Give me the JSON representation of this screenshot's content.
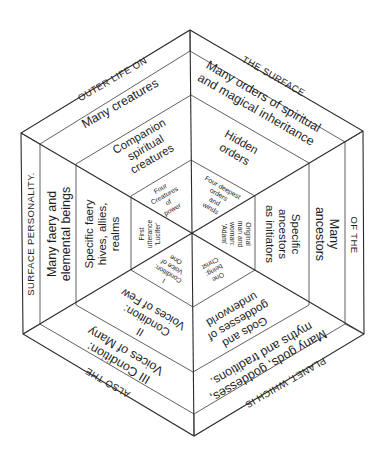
{
  "diagram": {
    "type": "concentric-hexagon",
    "outer_band": {
      "top_left": "OUTER LIFE ON",
      "top_right": "THE SURFACE",
      "right": "OF THE",
      "bottom_right": "PLANET, WHICH IS",
      "bottom_left": "ALSO THE",
      "left": "SURFACE PERSONALITY."
    },
    "ring2": {
      "top_left": "Many creatures",
      "top_right_line1": "Many orders of spiritual",
      "top_right_line2": "and magical inheritance",
      "right_line1": "Many",
      "right_line2": "ancestors",
      "bottom_right_line1": "Many gods, goddesses,",
      "bottom_right_line2": "myths and traditions.",
      "bottom_left_line1": "III Condition:",
      "bottom_left_line2": "Voices of Many",
      "left_line1": "Many faery and",
      "left_line2": "elemental beings"
    },
    "ring3": {
      "top_left_line1": "Companion",
      "top_left_line2": "spiritual",
      "top_left_line3": "creatures",
      "top_right_line1": "Hidden",
      "top_right_line2": "orders",
      "right_line1": "Specific",
      "right_line2": "ancestors",
      "right_line3": "as initiators",
      "bottom_right_line1": "Gods and",
      "bottom_right_line2": "goddesses of",
      "bottom_right_line3": "underworld",
      "bottom_left_line1": "II",
      "bottom_left_line2": "Condition:",
      "bottom_left_line3": "Voices of Few",
      "left_line1": "Specific faery",
      "left_line2": "hives, allies,",
      "left_line3": "realms"
    },
    "core": {
      "top_left_line1": "Four",
      "top_left_line2": "Creatures",
      "top_left_line3": "of",
      "top_left_line4": "power",
      "top_right_line1": "Four deepest",
      "top_right_line2": "orders",
      "top_right_line3": "and",
      "top_right_line4": "winds",
      "right_line1": "Original",
      "right_line2": "man and",
      "right_line3": "woman:",
      "right_line4": "'Adam'",
      "bottom_right_line1": "One",
      "bottom_right_line2": "being:",
      "bottom_right_line3": "Christ",
      "bottom_left_line1": "I",
      "bottom_left_line2": "Condition:",
      "bottom_left_line3": "Voice of",
      "bottom_left_line4": "One",
      "left_line1": "First",
      "left_line2": "utterance",
      "left_line3": "'Lucifer'"
    },
    "colors": {
      "line": "#2a2a2a",
      "text": "#1e1e1e",
      "background": "#ffffff"
    }
  }
}
